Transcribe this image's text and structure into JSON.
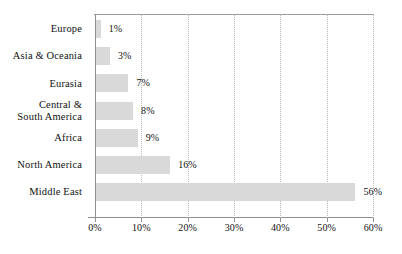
{
  "chart_data": {
    "type": "bar",
    "orientation": "horizontal",
    "title": "",
    "subtitle": "",
    "xlabel": "",
    "ylabel": "",
    "xlim": [
      0,
      60
    ],
    "ylim": null,
    "grid": "vertical-dotted",
    "legend": null,
    "categories": [
      "Europe",
      "Asia & Oceania",
      "Eurasia",
      "Central &\nSouth America",
      "Africa",
      "North America",
      "Middle East"
    ],
    "values": [
      1,
      3,
      7,
      8,
      9,
      16,
      56
    ],
    "value_labels": [
      "1%",
      "3%",
      "7%",
      "8%",
      "9%",
      "16%",
      "56%"
    ],
    "xticks": [
      0,
      10,
      20,
      30,
      40,
      50,
      60
    ],
    "xtick_labels": [
      "0%",
      "10%",
      "20%",
      "30%",
      "40%",
      "50%",
      "60%"
    ],
    "colors": {
      "bar_fill": "#d9d9d9",
      "background": "#ffffff",
      "axis_line": "#8f8f8f",
      "gridline": "#b9b9b9",
      "text": "#111111"
    }
  }
}
